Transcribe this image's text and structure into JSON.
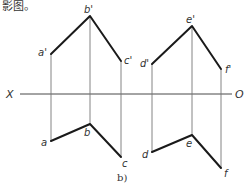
{
  "caption_top": "影图。",
  "subfigure_label": "b)",
  "axis": {
    "left_label": "X",
    "right_label": "O",
    "y": 94,
    "x1": 20,
    "x2": 232
  },
  "figures": [
    {
      "name": "left-broken-line",
      "front_view": [
        {
          "label": "a'",
          "x": 51,
          "y": 54
        },
        {
          "label": "b'",
          "x": 90,
          "y": 16
        },
        {
          "label": "c'",
          "x": 121,
          "y": 61
        }
      ],
      "top_view": [
        {
          "label": "a",
          "x": 51,
          "y": 141
        },
        {
          "label": "b",
          "x": 90,
          "y": 124
        },
        {
          "label": "c",
          "x": 121,
          "y": 157
        }
      ]
    },
    {
      "name": "right-broken-line",
      "front_view": [
        {
          "label": "d'",
          "x": 152,
          "y": 64
        },
        {
          "label": "e'",
          "x": 192,
          "y": 26
        },
        {
          "label": "f'",
          "x": 221,
          "y": 69
        }
      ],
      "top_view": [
        {
          "label": "d",
          "x": 152,
          "y": 152
        },
        {
          "label": "e",
          "x": 192,
          "y": 135
        },
        {
          "label": "f",
          "x": 221,
          "y": 168
        }
      ]
    }
  ],
  "colors": {
    "thick_line": "#1a1a1a",
    "projection_line": "#777777",
    "text": "#333333"
  }
}
